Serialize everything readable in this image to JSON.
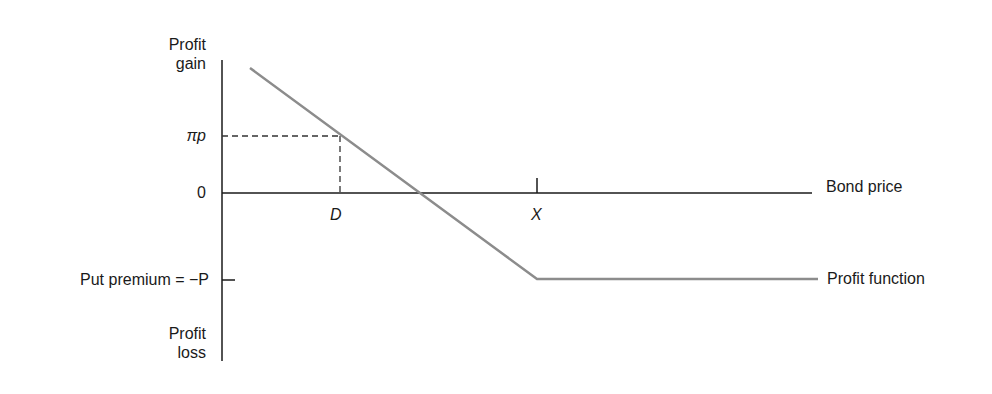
{
  "diagram": {
    "y_axis": {
      "top_label": [
        "Profit",
        "gain"
      ],
      "bottom_label": [
        "Profit",
        "loss"
      ],
      "ticks": {
        "pi_p": "πp",
        "zero": "0",
        "put_premium": "Put premium = −P"
      }
    },
    "x_axis": {
      "label": "Bond price",
      "ticks": {
        "D": "D",
        "X": "X"
      }
    },
    "curve_label": "Profit function",
    "colors": {
      "axis": "#1a1a1a",
      "curve": "#8c8c8c",
      "dash": "#333333"
    }
  }
}
